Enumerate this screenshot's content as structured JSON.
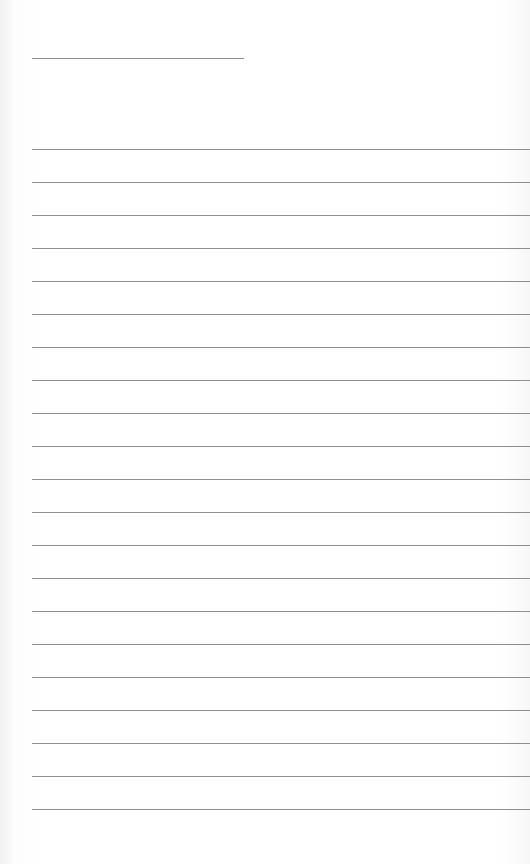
{
  "page": {
    "type": "lined-paper",
    "header_line": {
      "x": 32,
      "y": 58,
      "width": 212
    },
    "rules": {
      "count": 21,
      "first_y": 149,
      "spacing": 33,
      "left": 32
    },
    "colors": {
      "paper": "#ffffff",
      "line": "#8e8e8e"
    }
  }
}
